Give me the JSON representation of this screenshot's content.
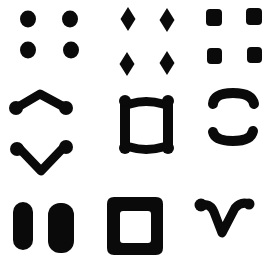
{
  "title": "Gestalt grouping patterns 3x3",
  "colors": {
    "ink": "#0a0a0a",
    "background": "#ffffff"
  },
  "grid": {
    "rows": 3,
    "cols": 3
  },
  "cells": [
    {
      "id": "cell-1",
      "label": "four circular dots",
      "shape": "dots"
    },
    {
      "id": "cell-2",
      "label": "four diamonds",
      "shape": "diamonds"
    },
    {
      "id": "cell-3",
      "label": "four rounded squares",
      "shape": "squares"
    },
    {
      "id": "cell-4",
      "label": "caret and V with dot ends",
      "shape": "caret-v"
    },
    {
      "id": "cell-5",
      "label": "square made of four bars with dots",
      "shape": "bar-square"
    },
    {
      "id": "cell-6",
      "label": "two opposing arcs",
      "shape": "arcs"
    },
    {
      "id": "cell-7",
      "label": "two vertical pills",
      "shape": "pills"
    },
    {
      "id": "cell-8",
      "label": "square ring",
      "shape": "ring"
    },
    {
      "id": "cell-9",
      "label": "curled V shape",
      "shape": "curled-v"
    }
  ]
}
